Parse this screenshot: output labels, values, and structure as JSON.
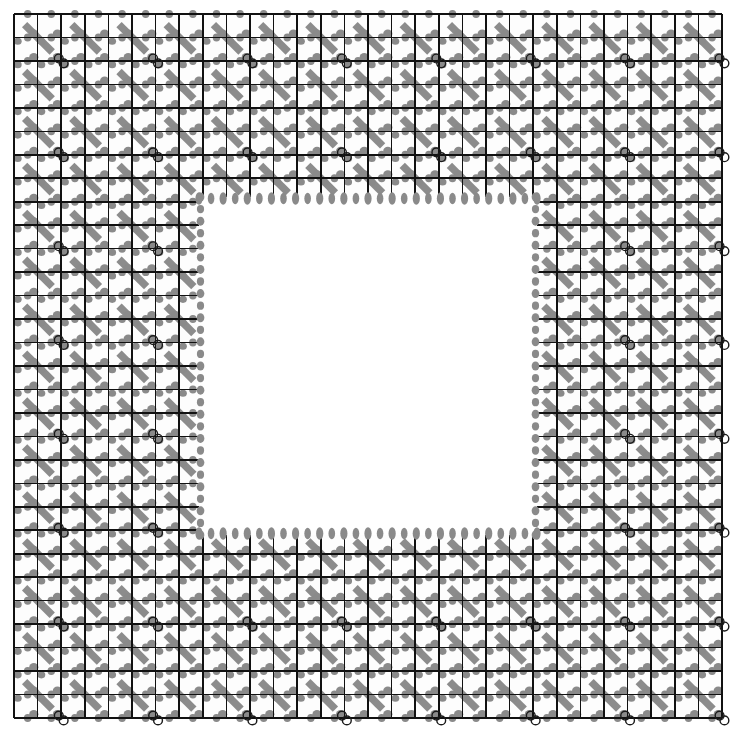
{
  "figure": {
    "title": "Hatched grid pattern with central square cutout",
    "canvas": {
      "width": 739,
      "height": 742,
      "background": "#ffffff"
    },
    "grid": {
      "x0": 14,
      "y0": 14,
      "x1": 722,
      "y1": 718,
      "cols": 30,
      "rows": 30,
      "cell_w": 23.6,
      "cell_h": 23.47,
      "line_color": "#111111",
      "line_width": 1.6,
      "cell_fill": "#fdfdfd"
    },
    "cutout": {
      "label": "inner white square",
      "x0": 199,
      "y0": 197,
      "x1": 537,
      "y1": 535,
      "fill": "#ffffff",
      "edge_dot_color": "#8a8a8a",
      "edge_dot_rx": 3.6,
      "edge_dot_ry": 6.2
    },
    "hatch": {
      "label": "diagonal stripe motif",
      "color": "#8c8c8c",
      "direction": "down-right",
      "stripe_width": 7.5,
      "period_cells": 2
    },
    "nub": {
      "label": "corner blob",
      "color": "#8a8a8a",
      "rx": 4.6,
      "ry": 4.2
    },
    "ring_marker": {
      "label": "double-circle marker",
      "stroke": "#1a1a1a",
      "fill": "none",
      "stroke_width": 1.4,
      "r": 4.4,
      "period_cells": 4,
      "offset_cells": 2
    },
    "legend": {
      "grid_label": "grid",
      "cutout_label": "cutout",
      "hatch_label": "hatch",
      "marker_label": "marker"
    }
  },
  "chart_data": {
    "type": "heatmap",
    "title": "Hatched grid pattern with central square cutout",
    "xlabel": "",
    "ylabel": "",
    "categories": [],
    "values": [],
    "grid": true,
    "legend_position": "none",
    "nx": 30,
    "ny": 30,
    "cutout_cells": {
      "col_start": 8,
      "col_end": 22,
      "row_start": 8,
      "row_end": 22
    }
  }
}
